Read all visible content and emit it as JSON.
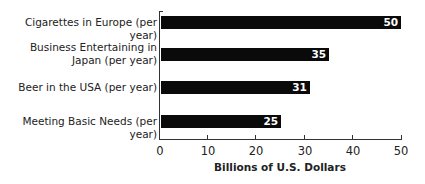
{
  "chart_data": {
    "type": "bar",
    "orientation": "horizontal",
    "title": "",
    "xlabel": "Billions of U.S. Dollars",
    "ylabel": "",
    "xlim": [
      0,
      50
    ],
    "xticks": [
      0,
      10,
      20,
      30,
      40,
      50
    ],
    "grid": false,
    "legend": null,
    "categories": [
      "Cigarettes in Europe (per year)",
      "Business Entertaining in Japan (per year)",
      "Beer in the USA (per year)",
      "Meeting Basic Needs (per year)"
    ],
    "values": [
      50,
      35,
      31,
      25
    ],
    "bar_color": "#0a0a0a",
    "value_label_color": "#ffffff"
  },
  "labels": {
    "cat0": "Cigarettes in Europe (per year)",
    "cat1": "Business Entertaining in\nJapan (per year)",
    "cat2": "Beer in the USA (per year)",
    "cat3": "Meeting Basic Needs (per year)",
    "val0": "50",
    "val1": "35",
    "val2": "31",
    "val3": "25",
    "tick0": "0",
    "tick1": "10",
    "tick2": "20",
    "tick3": "30",
    "tick4": "40",
    "tick5": "50",
    "xtitle": "Billions of U.S. Dollars"
  }
}
